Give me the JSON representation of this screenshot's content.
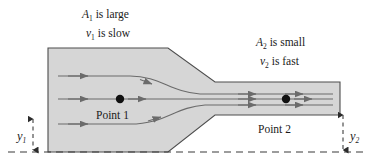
{
  "figure": {
    "pipe": {
      "fill_color": "#d6d6d6",
      "stroke_color": "#4d4d4d"
    },
    "streamline_color": "#6b6b6b",
    "datum_color": "#3a3a3a"
  },
  "annotations": {
    "inlet": {
      "area_var": "A",
      "area_sub": "1",
      "area_text": " is large",
      "speed_var": "v",
      "speed_sub": "1",
      "speed_text": " is slow"
    },
    "outlet": {
      "area_var": "A",
      "area_sub": "2",
      "area_text": " is small",
      "speed_var": "v",
      "speed_sub": "2",
      "speed_text": " is fast"
    },
    "point1": "Point 1",
    "point2": "Point 2",
    "height1_var": "y",
    "height1_sub": "1",
    "height2_var": "y",
    "height2_sub": "2"
  }
}
